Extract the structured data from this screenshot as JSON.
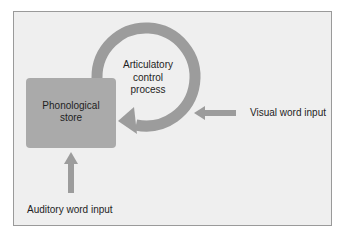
{
  "diagram": {
    "colors": {
      "background": "#efefef",
      "frame_border": "#9a9a9a",
      "box_fill": "#aaaaaa",
      "arrow_fill": "#9c9c9c",
      "text": "#1e1e1e"
    },
    "nodes": {
      "phonological_store": {
        "line1": "Phonological",
        "line2": "store"
      },
      "articulatory_control": {
        "line1": "Articulatory",
        "line2": "control",
        "line3": "process"
      }
    },
    "inputs": {
      "visual": {
        "label": "Visual word input",
        "arrow_direction": "left"
      },
      "auditory": {
        "label": "Auditory word input",
        "arrow_direction": "up"
      }
    },
    "loop": {
      "from": "phonological_store",
      "through": "articulatory_control",
      "to": "phonological_store",
      "direction": "clockwise"
    }
  }
}
